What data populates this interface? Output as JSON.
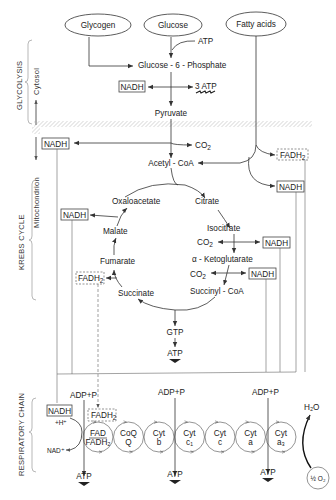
{
  "sources": {
    "glycogen": "Glycogen",
    "glucose": "Glucose",
    "fatty_acids": "Fatty acids"
  },
  "glycolysis": {
    "atp_in": "ATP",
    "g6p": "Glucose - 6 - Phosphate",
    "nadh": "NADH",
    "atp_out": "3 ATP",
    "pyruvate": "Pyruvate"
  },
  "link": {
    "nadh": "NADH",
    "co2": "CO",
    "co2_sub": "2",
    "acetyl_coa": "Acetyl - CoA",
    "fadh2": "FADH",
    "fadh2_sub": "2",
    "fa_nadh": "NADH"
  },
  "krebs": {
    "oxaloacetate": "Oxaloacetate",
    "citrate": "Citrate",
    "isocitrate": "Isocitrate",
    "co2_1": "CO",
    "co2_1_sub": "2",
    "nadh_1": "NADH",
    "alpha_kg": "α - Ketoglutarate",
    "co2_2": "CO",
    "co2_2_sub": "2",
    "nadh_2": "NADH",
    "succinyl_coa": "Succinyl - CoA",
    "succinate": "Succinate",
    "fadh2": "FADH",
    "fadh2_sub": "2",
    "fumarate": "Fumarate",
    "malate": "Malate",
    "nadh_malate": "NADH",
    "gtp": "GTP",
    "atp": "ATP"
  },
  "respiratory": {
    "adp_p": [
      "ADP+P",
      "ADP+P",
      "ADP+P"
    ],
    "nadh": "NADH",
    "h_plus": "+H⁺",
    "nad_plus": "NAD⁺",
    "fadh2": "FADH",
    "fadh2_sub": "2",
    "carriers": [
      {
        "top": "FAD",
        "bottom": "FADH₂"
      },
      {
        "top": "CoQ",
        "bottom": "Q"
      },
      {
        "top": "Cyt",
        "bottom": "b"
      },
      {
        "top": "Cyt",
        "bottom": "c₁"
      },
      {
        "top": "Cyt",
        "bottom": "c"
      },
      {
        "top": "Cyt",
        "bottom": "a"
      },
      {
        "top": "Cyt",
        "bottom": "a₃"
      }
    ],
    "atp": [
      "ATP",
      "ATP",
      "ATP"
    ],
    "h2o": "H₂O",
    "o2": "½ O₂"
  },
  "side_labels": {
    "glycolysis": "GLYCOLYSIS",
    "cytosol": "Cytosol",
    "mitochondrion": "Mitochondrion",
    "krebs": "KREBS  CYCLE",
    "respiratory": "RESPIRATORY  CHAIN"
  }
}
